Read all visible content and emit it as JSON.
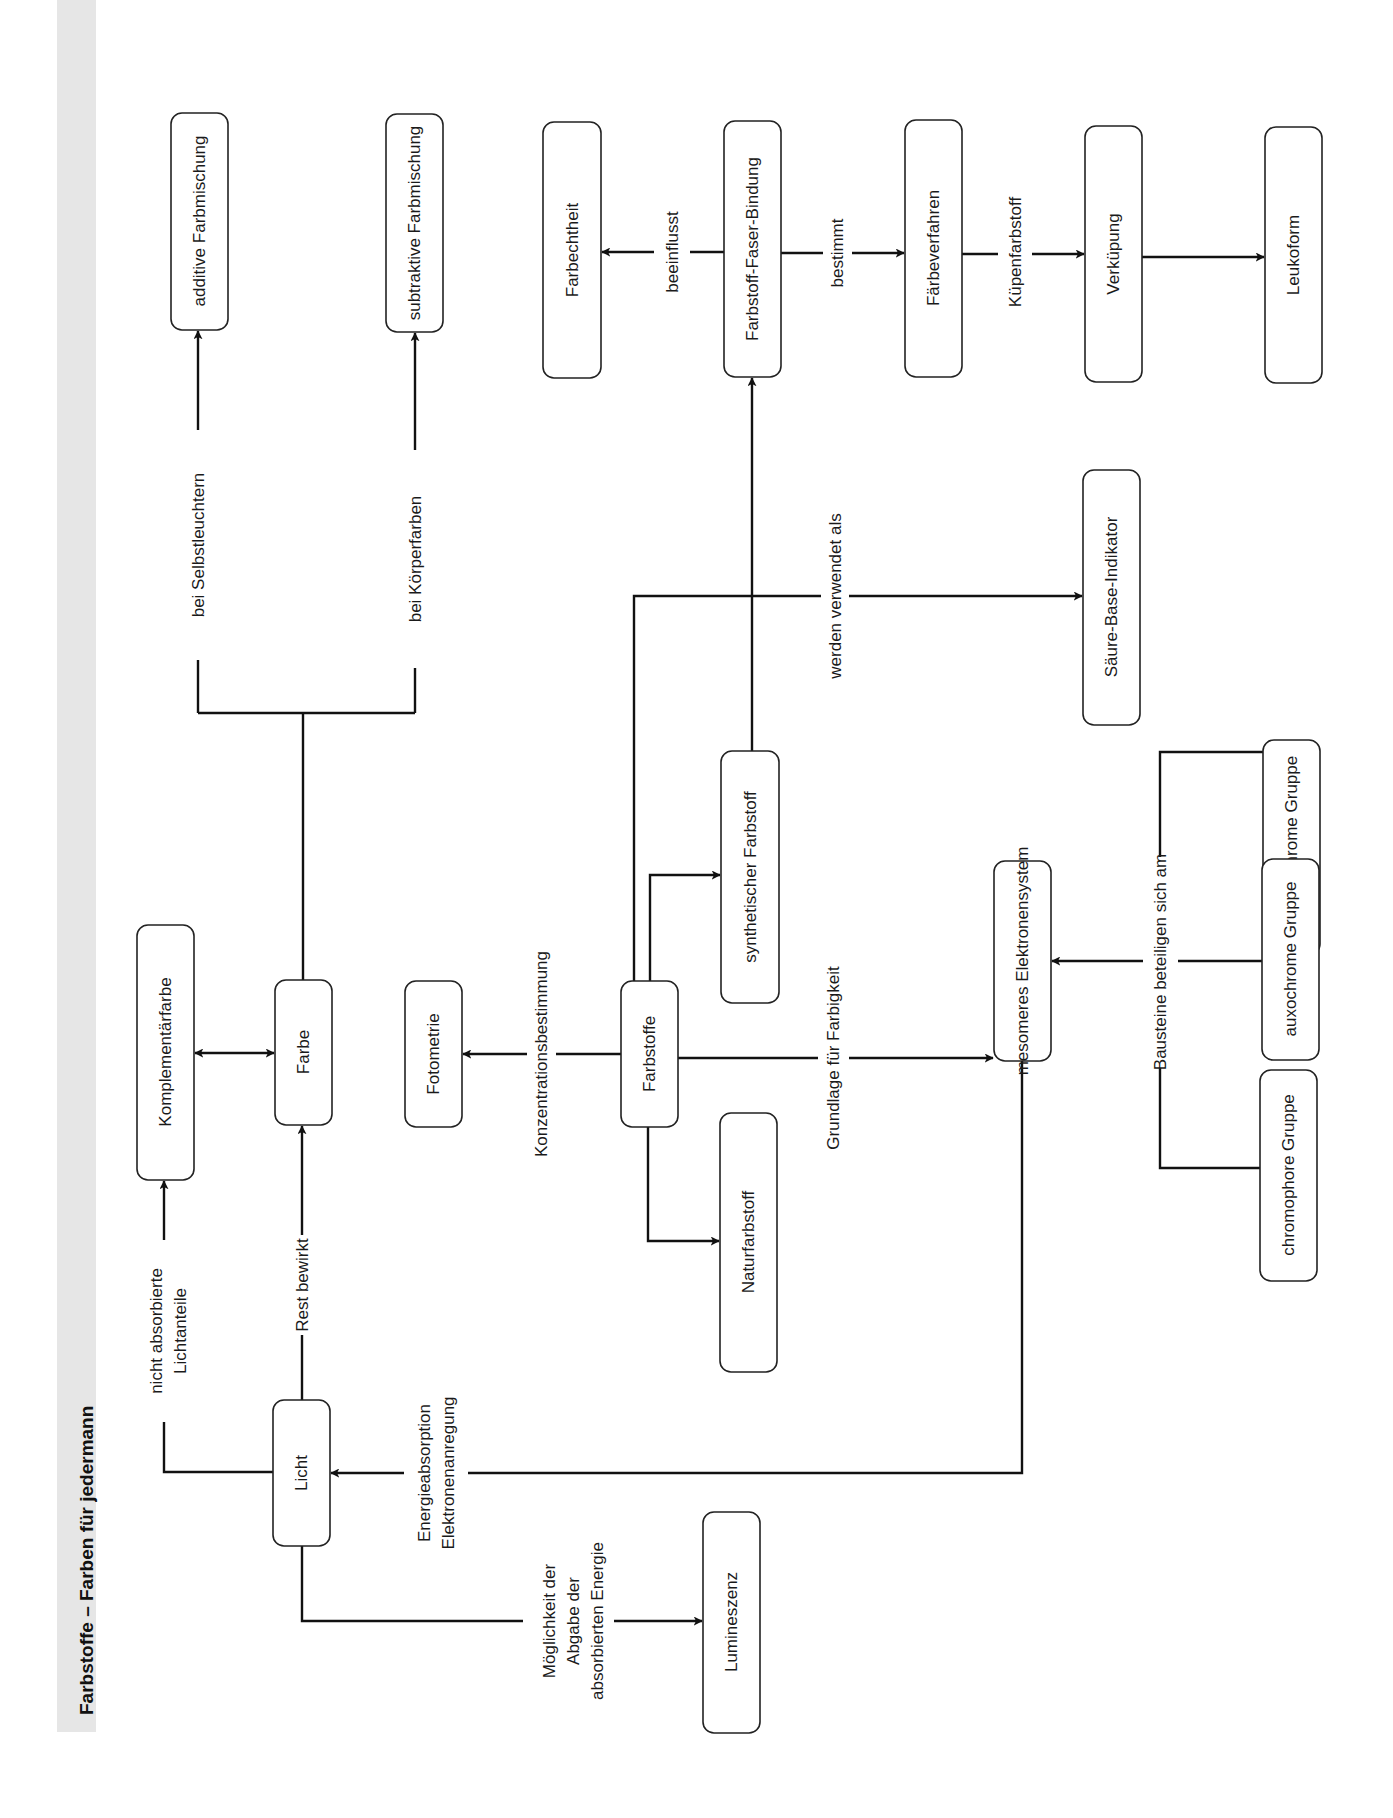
{
  "title": "Farbstoffe – Farben für jedermann",
  "nodes": {
    "additive": "additive Farbmischung",
    "subtraktive": "subtraktive Farbmischung",
    "farbechtheit": "Farbechtheit",
    "faser_bindung": "Farbstoff-Faser-Bindung",
    "faerbeverfahren": "Färbeverfahren",
    "verkuepung": "Verküpung",
    "leukoform": "Leukoform",
    "indikator": "Säure-Base-Indikator",
    "synthetisch": "synthetischer Farbstoff",
    "antiauxochrom": "antiauxochrome Gruppe",
    "komplementaer": "Komplementärfarbe",
    "farbe": "Farbe",
    "fotometrie": "Fotometrie",
    "farbstoffe": "Farbstoffe",
    "mesomer": "mesomeres Elektronensystem",
    "auxochrom": "auxochrome Gruppe",
    "naturfarbstoff": "Naturfarbstoff",
    "chromophor": "chromophore Gruppe",
    "licht": "Licht",
    "lumineszenz": "Lumineszenz"
  },
  "edge_labels": {
    "selbstleuchtern": "bei Selbstleuchtern",
    "koerperfarben": "bei Körperfarben",
    "beeinflusst": "beeinflusst",
    "bestimmt": "bestimmt",
    "kuepenfarbstoff": "Küpenfarbstoff",
    "verwendet": "werden verwendet als",
    "konzentration": "Konzentrationsbestimmung",
    "grundlage": "Grundlage für Farbigkeit",
    "bausteine": "Bausteine beteiligen sich am",
    "nicht_absorbiert_1": "nicht absorbierte",
    "nicht_absorbiert_2": "Lichtanteile",
    "rest": "Rest bewirkt",
    "energie_1": "Energieabsorption",
    "energie_2": "Elektronenanregung",
    "abgabe_1": "Möglichkeit der",
    "abgabe_2": "Abgabe der",
    "abgabe_3": "absorbierten Energie"
  },
  "colors": {
    "line": "#111111",
    "band": "#e6e6e6",
    "box_border": "#222222"
  }
}
